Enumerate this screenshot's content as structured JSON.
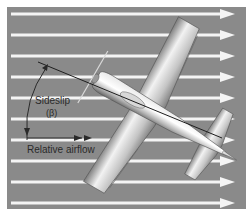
{
  "diagram": {
    "colors": {
      "background": "#ffffff",
      "panel": "#8a8a8a",
      "airflow_arrow": "#f4f4f4",
      "label_text": "#2a2a2a",
      "reference_line": "#222222",
      "aircraft_light": "#f2f2f2",
      "aircraft_mid": "#bdbdbd",
      "aircraft_dark": "#6e6e6e"
    },
    "airflow": {
      "direction": "left-to-right",
      "arrow_count": 10
    },
    "labels": {
      "sideslip": "Sideslip",
      "beta": "(β)",
      "relative_airflow": "Relative airflow"
    },
    "aircraft": {
      "view": "top-down",
      "heading_offset_from_airflow_deg": -30
    }
  }
}
